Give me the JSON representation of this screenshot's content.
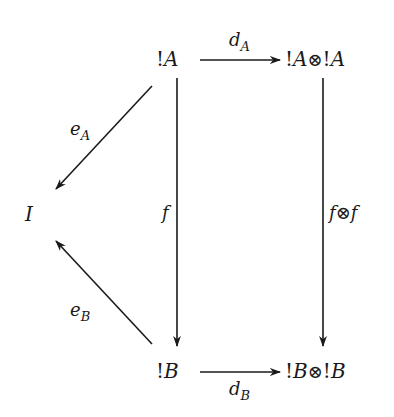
{
  "diagram": {
    "type": "commutative-diagram",
    "background": "#ffffff",
    "ink": "#1a1a1a",
    "nodes": {
      "bangA": {
        "bang": "!",
        "obj": "A"
      },
      "bangAtensor": {
        "bang1": "!",
        "obj1": "A",
        "op": "⊗",
        "bang2": "!",
        "obj2": "A"
      },
      "I": {
        "obj": "I"
      },
      "bangB": {
        "bang": "!",
        "obj": "B"
      },
      "bangBtensor": {
        "bang1": "!",
        "obj1": "B",
        "op": "⊗",
        "bang2": "!",
        "obj2": "B"
      }
    },
    "edges": {
      "dA": {
        "base": "d",
        "sub": "A",
        "from": "!A",
        "to": "!A⊗!A"
      },
      "eA": {
        "base": "e",
        "sub": "A",
        "from": "!A",
        "to": "I"
      },
      "f": {
        "base": "f",
        "from": "!A",
        "to": "!B"
      },
      "ftensorf": {
        "f1": "f",
        "op": "⊗",
        "f2": "f",
        "from": "!A⊗!A",
        "to": "!B⊗!B"
      },
      "eB": {
        "base": "e",
        "sub": "B",
        "from": "!B",
        "to": "I"
      },
      "dB": {
        "base": "d",
        "sub": "B",
        "from": "!B",
        "to": "!B⊗!B"
      }
    }
  }
}
